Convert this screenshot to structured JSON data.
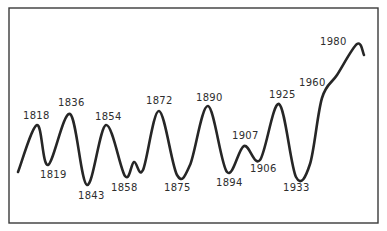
{
  "chart_data": {
    "type": "line",
    "title": "",
    "xlabel": "",
    "ylabel": "",
    "grid": false,
    "legend": null,
    "axes_visible": false,
    "series": [
      {
        "name": "cycle",
        "points": [
          {
            "x": 18,
            "y": 172,
            "label": ""
          },
          {
            "x": 37,
            "y": 125,
            "label": "1818",
            "kind": "peak"
          },
          {
            "x": 48,
            "y": 165,
            "label": "1819",
            "kind": "trough"
          },
          {
            "x": 70,
            "y": 114,
            "label": "1836",
            "kind": "peak"
          },
          {
            "x": 87,
            "y": 185,
            "label": "1843",
            "kind": "trough"
          },
          {
            "x": 106,
            "y": 125,
            "label": "1854",
            "kind": "peak"
          },
          {
            "x": 125,
            "y": 176,
            "label": "1858",
            "kind": "trough"
          },
          {
            "x": 134,
            "y": 162,
            "label": "",
            "kind": "minor-peak"
          },
          {
            "x": 143,
            "y": 170,
            "label": "",
            "kind": "minor-trough"
          },
          {
            "x": 159,
            "y": 111,
            "label": "1872",
            "kind": "peak"
          },
          {
            "x": 177,
            "y": 175,
            "label": "1875",
            "kind": "trough"
          },
          {
            "x": 208,
            "y": 106,
            "label": "1890",
            "kind": "peak"
          },
          {
            "x": 227,
            "y": 172,
            "label": "1894",
            "kind": "trough"
          },
          {
            "x": 244,
            "y": 146,
            "label": "1907",
            "kind": "peak"
          },
          {
            "x": 260,
            "y": 160,
            "label": "1906",
            "kind": "trough"
          },
          {
            "x": 279,
            "y": 104,
            "label": "1925",
            "kind": "peak"
          },
          {
            "x": 296,
            "y": 177,
            "label": "1933",
            "kind": "trough"
          },
          {
            "x": 322,
            "y": 98,
            "label": "1960",
            "kind": "inflection"
          },
          {
            "x": 357,
            "y": 44,
            "label": "1980",
            "kind": "peak"
          },
          {
            "x": 364,
            "y": 55,
            "label": ""
          }
        ],
        "relative_values": {
          "1818": 42,
          "1819": 14,
          "1836": 50,
          "1843": 0,
          "1854": 42,
          "1858": 6,
          "1872": 52,
          "1875": 7,
          "1890": 56,
          "1894": 9,
          "1907": 28,
          "1906": 18,
          "1925": 57,
          "1933": 6,
          "1960": 62,
          "1980": 100
        }
      }
    ],
    "labels": [
      {
        "text": "1818",
        "x": 23,
        "y": 119
      },
      {
        "text": "1819",
        "x": 40,
        "y": 178
      },
      {
        "text": "1836",
        "x": 58,
        "y": 106
      },
      {
        "text": "1843",
        "x": 78,
        "y": 199
      },
      {
        "text": "1854",
        "x": 95,
        "y": 120
      },
      {
        "text": "1858",
        "x": 111,
        "y": 191
      },
      {
        "text": "1872",
        "x": 146,
        "y": 104
      },
      {
        "text": "1875",
        "x": 164,
        "y": 191
      },
      {
        "text": "1890",
        "x": 196,
        "y": 101
      },
      {
        "text": "1894",
        "x": 216,
        "y": 186
      },
      {
        "text": "1907",
        "x": 232,
        "y": 139
      },
      {
        "text": "1906",
        "x": 250,
        "y": 172
      },
      {
        "text": "1925",
        "x": 269,
        "y": 98
      },
      {
        "text": "1933",
        "x": 283,
        "y": 191
      },
      {
        "text": "1960",
        "x": 299,
        "y": 86
      },
      {
        "text": "1980",
        "x": 320,
        "y": 45
      }
    ],
    "frame": {
      "x": 9,
      "y": 8,
      "width": 369,
      "height": 215
    },
    "colors": {
      "line": "#262626",
      "frame": "#3a3a3a",
      "text": "#2e2e2e",
      "background": "#ffffff"
    }
  }
}
